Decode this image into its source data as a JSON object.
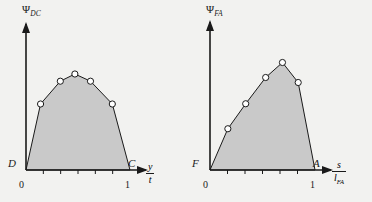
{
  "figure": {
    "background_color": "#f2f2f0",
    "fill_color": "#c9c9c9",
    "line_color": "#1a1a1a",
    "marker_face_color": "#ffffff"
  },
  "chart_data": [
    {
      "type": "area",
      "id": "left-plot",
      "title": "",
      "ylabel": "Ψ",
      "ylabel_sub": "DC",
      "xlabel_numerator": "y",
      "xlabel_denominator": "t",
      "xlabel_denominator_sub": "",
      "origin_label": "D",
      "end_label": "C",
      "xtick_labels": [
        "0",
        "1"
      ],
      "xtick_values": [
        0,
        1
      ],
      "xlim": [
        0,
        1
      ],
      "ylim": [
        0,
        1
      ],
      "grid": false,
      "legend": false,
      "minor_tick_count": 5,
      "x": [
        0.0,
        0.14,
        0.33,
        0.47,
        0.62,
        0.83,
        1.0
      ],
      "y": [
        0.0,
        0.55,
        0.74,
        0.8,
        0.74,
        0.55,
        0.0
      ],
      "markers_shown_at": [
        0.14,
        0.33,
        0.47,
        0.62,
        0.83
      ]
    },
    {
      "type": "area",
      "id": "right-plot",
      "title": "",
      "ylabel": "Ψ",
      "ylabel_sub": "FA",
      "xlabel_numerator": "s",
      "xlabel_denominator": "l",
      "xlabel_denominator_sub": "FA",
      "origin_label": "F",
      "end_label": "A",
      "xtick_labels": [
        "0",
        "1"
      ],
      "xtick_values": [
        0,
        1
      ],
      "xlim": [
        0,
        1
      ],
      "ylim": [
        0,
        1
      ],
      "grid": false,
      "legend": false,
      "minor_tick_count": 5,
      "x": [
        0.0,
        0.17,
        0.34,
        0.53,
        0.69,
        0.84,
        1.0
      ],
      "y": [
        0.0,
        0.33,
        0.53,
        0.74,
        0.86,
        0.7,
        0.0
      ],
      "markers_shown_at": [
        0.17,
        0.34,
        0.53,
        0.69,
        0.84
      ]
    }
  ]
}
